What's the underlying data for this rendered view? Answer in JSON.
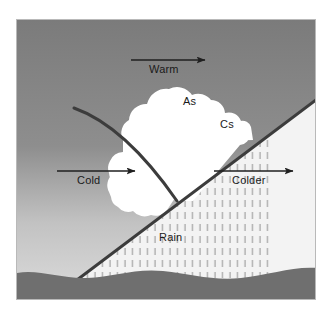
{
  "figure": {
    "labels": {
      "warm": "Warm",
      "cold": "Cold",
      "colder": "Colder",
      "altostratus": "As",
      "cirrostratus": "Cs",
      "rain": "Rain"
    },
    "colors": {
      "sky_top": "#7d7d7d",
      "sky_bottom": "#d9d9d9",
      "warm_sector": "#f2f2f2",
      "cloud": "#ffffff",
      "ground": "#6f6f6f",
      "front_line": "#3a3a3a",
      "arrow": "#1f1f1f",
      "rain_streak": "#9a9a9a",
      "text": "#1a1a1a",
      "frame_border": "#b9b9b9",
      "matte": "#ffffff"
    },
    "arrows": [
      {
        "name": "warm-flow-arrow",
        "x1": 130,
        "y1": 59,
        "x2": 205,
        "y2": 59,
        "direction": "right"
      },
      {
        "name": "cold-flow-arrow",
        "x1": 56,
        "y1": 170,
        "x2": 134,
        "y2": 170,
        "direction": "right"
      },
      {
        "name": "colder-flow-arrow",
        "x1": 213,
        "y1": 170,
        "x2": 292,
        "y2": 170,
        "direction": "right"
      }
    ],
    "fronts": [
      {
        "name": "cold-front-line",
        "type": "curved",
        "from": [
          57,
          88
        ],
        "to": [
          160,
          178
        ]
      },
      {
        "name": "warm-front-line",
        "type": "straight",
        "from": [
          44,
          272
        ],
        "to": [
          300,
          79
        ]
      }
    ]
  }
}
